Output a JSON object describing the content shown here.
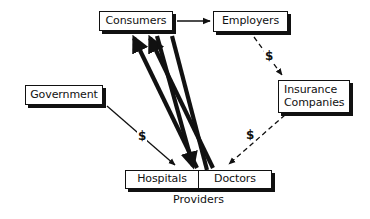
{
  "diagram": {
    "background_color": "#ffffff",
    "stroke_color": "#111111",
    "nodes": [
      {
        "id": "consumers",
        "label": "Consumers",
        "x": 99,
        "y": 11,
        "w": 74,
        "h": 20
      },
      {
        "id": "employers",
        "label": "Employers",
        "x": 213,
        "y": 11,
        "w": 75,
        "h": 21
      },
      {
        "id": "government",
        "label": "Government",
        "x": 25,
        "y": 85,
        "w": 78,
        "h": 20
      },
      {
        "id": "insurance",
        "label_line1": "Insurance",
        "label_line2": "Companies",
        "x": 278,
        "y": 80,
        "w": 72,
        "h": 33
      },
      {
        "id": "providers",
        "cell1": "Hospitals",
        "cell2": "Doctors",
        "caption": "Providers",
        "x": 125,
        "y": 170,
        "w": 147,
        "h": 19
      }
    ],
    "edges": [
      {
        "id": "consumers-to-employers",
        "from": "consumers",
        "to": "employers",
        "style": "solid",
        "weight": "thin",
        "label": ""
      },
      {
        "id": "employers-to-insurance",
        "from": "employers",
        "to": "insurance",
        "style": "dashed",
        "weight": "thin",
        "label": "$"
      },
      {
        "id": "insurance-to-doctors",
        "from": "insurance",
        "to": "doctors",
        "style": "dashed",
        "weight": "thin",
        "label": "$"
      },
      {
        "id": "government-to-hospitals",
        "from": "government",
        "to": "hospitals",
        "style": "solid",
        "weight": "thin",
        "label": "$"
      },
      {
        "id": "hospitals-to-consumers",
        "from": "hospitals",
        "to": "consumers",
        "style": "solid",
        "weight": "thick",
        "label": ""
      },
      {
        "id": "doctors-to-consumers",
        "from": "doctors",
        "to": "consumers",
        "style": "solid",
        "weight": "thick",
        "label": ""
      },
      {
        "id": "consumers-to-hospitals",
        "from": "consumers",
        "to": "hospitals",
        "style": "solid",
        "weight": "thick",
        "label": ""
      },
      {
        "id": "consumers-to-doctors",
        "from": "consumers",
        "to": "doctors",
        "style": "solid",
        "weight": "thick",
        "label": ""
      }
    ],
    "labels": {
      "dollar_employers_insurance": "$",
      "dollar_government_hospitals": "$",
      "dollar_insurance_doctors": "$"
    }
  }
}
